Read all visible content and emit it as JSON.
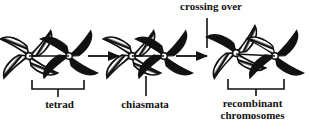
{
  "figure": {
    "title_present": false,
    "background_color": "#ffffff",
    "ink_color": "#111111",
    "stages": [
      {
        "id": "tetrad",
        "label": "tetrad",
        "label_position": "below",
        "chromosomes": [
          {
            "name": "maternal-chromosome",
            "fill": "hatched",
            "arms": [
              "hatched",
              "hatched",
              "hatched",
              "hatched"
            ]
          },
          {
            "name": "paternal-chromosome",
            "fill": "solid",
            "arms": [
              "solid",
              "solid",
              "solid",
              "solid"
            ]
          }
        ],
        "bracket": true
      },
      {
        "id": "chiasmata",
        "label": "chiasmata",
        "label_position": "below",
        "chromosomes": [
          {
            "name": "maternal-chromosome",
            "fill": "hatched",
            "arms": [
              "hatched",
              "hatched",
              "hatched",
              "hatched"
            ]
          },
          {
            "name": "paternal-chromosome",
            "fill": "solid",
            "arms": [
              "solid",
              "solid",
              "solid",
              "solid"
            ]
          }
        ],
        "pointer": true,
        "bracket": false
      },
      {
        "id": "recombinant",
        "label_line1": "recombinant",
        "label_line2": "chromosomes",
        "label_position": "below",
        "chromosomes": [
          {
            "name": "recombinant-chromosome-left",
            "fill": "hatched",
            "arms": [
              "hatched",
              "hatched",
              "hatched",
              "solid"
            ]
          },
          {
            "name": "recombinant-chromosome-right",
            "fill": "solid",
            "arms": [
              "solid",
              "solid",
              "hatched",
              "solid"
            ]
          }
        ],
        "bracket": true
      }
    ],
    "annotations": [
      {
        "id": "crossing-over",
        "label": "crossing over",
        "position": "above",
        "leader_line": true
      }
    ],
    "arrows": [
      {
        "id": "arrow-1",
        "from": "tetrad",
        "to": "chiasmata",
        "direction": "right"
      },
      {
        "id": "arrow-2",
        "from": "chiasmata",
        "to": "recombinant",
        "direction": "right"
      }
    ]
  }
}
